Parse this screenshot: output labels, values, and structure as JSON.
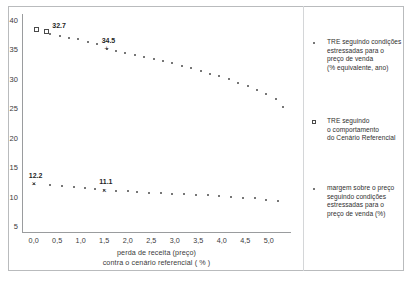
{
  "chart_data": {
    "type": "scatter",
    "title": "",
    "xlabel": "perda de receita (preço) contra o cenário referencial ( % )",
    "xlabel_line1": "perda de receita (preço)",
    "xlabel_line2": "contra o cenário referencial ( % )",
    "ylabel": "",
    "xlim": [
      -0.25,
      5.45
    ],
    "ylim": [
      4.0,
      41.0
    ],
    "grid": false,
    "legend_position": "right",
    "xticks": [
      "0,0",
      "0,5",
      "1,0",
      "1,5",
      "2,0",
      "2,5",
      "3,0",
      "3,5",
      "4,0",
      "4,5",
      "5,0"
    ],
    "xtick_values": [
      0.0,
      0.5,
      1.0,
      1.5,
      2.0,
      2.5,
      3.0,
      3.5,
      4.0,
      4.5,
      5.0
    ],
    "yticks": [
      "40",
      "35",
      "30",
      "25",
      "20",
      "15",
      "10",
      "5"
    ],
    "ytick_values": [
      40,
      35,
      30,
      25,
      20,
      15,
      10,
      5
    ],
    "series": [
      {
        "name": "TRE seguindo condições estressadas para o preço de venda (% equivalente, ano)",
        "marker": "dot",
        "x": [
          0.35,
          0.55,
          0.75,
          0.95,
          1.15,
          1.35,
          1.55,
          1.75,
          1.95,
          2.15,
          2.35,
          2.55,
          2.75,
          2.95,
          3.15,
          3.35,
          3.55,
          3.75,
          3.95,
          4.15,
          4.35,
          4.55,
          4.75,
          4.95,
          5.15,
          5.3
        ],
        "values": [
          37.6,
          37.3,
          37.0,
          36.7,
          36.3,
          35.9,
          35.1,
          34.7,
          34.3,
          34.0,
          33.7,
          33.4,
          33.0,
          32.6,
          32.2,
          31.8,
          31.4,
          30.9,
          30.4,
          29.9,
          29.3,
          28.7,
          28.1,
          27.4,
          26.6,
          25.3
        ]
      },
      {
        "name": "TRE seguindo o comportamento do Cenário Referencial",
        "marker": "square",
        "x": [
          0.05,
          0.28
        ],
        "values": [
          38.3,
          38.0
        ]
      },
      {
        "name": "margem sobre o preço seguindo condições estressadas para o preço de venda (%)",
        "marker": "cross",
        "x": [
          0.0,
          0.35,
          0.6,
          0.85,
          1.1,
          1.3,
          1.5,
          1.75,
          2.0,
          2.2,
          2.45,
          2.7,
          2.95,
          3.2,
          3.45,
          3.7,
          3.95,
          4.2,
          4.45,
          4.7,
          4.95,
          5.2
        ],
        "values": [
          12.2,
          11.9,
          11.75,
          11.6,
          11.45,
          11.3,
          11.1,
          11.0,
          10.9,
          10.8,
          10.7,
          10.6,
          10.5,
          10.4,
          10.3,
          10.2,
          10.1,
          10.0,
          9.85,
          9.7,
          9.5,
          9.3
        ]
      }
    ],
    "annotations": [
      {
        "text": "32.7",
        "x": 0.5,
        "y": 37.6,
        "series": 0
      },
      {
        "text": "34.5",
        "x": 1.55,
        "y": 35.1,
        "series": 0,
        "marker": "plus"
      },
      {
        "text": "12.2",
        "x": 0.0,
        "y": 12.2,
        "series": 2,
        "marker": "cross"
      },
      {
        "text": "11.1",
        "x": 1.5,
        "y": 11.1,
        "series": 2,
        "marker": "cross"
      }
    ],
    "legend_entries": [
      {
        "marker": "dot",
        "lines": [
          "TRE seguindo condições",
          "estressadas para o",
          "preço de venda",
          "(% equivalente, ano)"
        ]
      },
      {
        "marker": "square",
        "lines": [
          "TRE seguindo",
          "o comportamento",
          "do Cenário Referencial"
        ]
      },
      {
        "marker": "cross",
        "lines": [
          "margem sobre o preço",
          "seguindo condições",
          "estressadas para o",
          "preço de venda (%)"
        ]
      }
    ],
    "colors": {
      "marker": "#4a4a4a",
      "axis": "#9a9c9e",
      "frame": "#b9bbbd",
      "text": "#2f2f2f"
    }
  }
}
